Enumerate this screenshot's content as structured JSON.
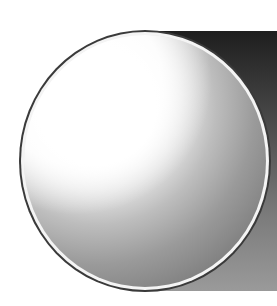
{
  "graphic": {
    "description": "Shaded gray sphere with white rim over a dark-to-gray gradient rectangle",
    "colors": {
      "background": "#ffffff",
      "rect_top": "#1e1e1e",
      "rect_bottom": "#9a9a9a",
      "sphere_highlight": "#ffffff",
      "sphere_shadow": "#6e6e6e",
      "rim": "#f4f4f4",
      "outline": "#3a3a3a"
    }
  }
}
